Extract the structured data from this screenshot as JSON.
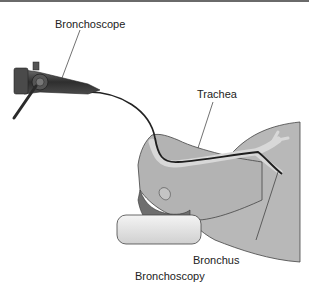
{
  "figure": {
    "caption": "Bronchoscopy",
    "labels": {
      "bronchoscope": "Bronchoscope",
      "trachea": "Trachea",
      "bronchus": "Bronchus"
    }
  },
  "colors": {
    "skin": "#b3b3b3",
    "hair": "#6e6e6e",
    "pillow": "#e6e6e6",
    "airway": "#d5d5d5",
    "scope": "#3a3a3a",
    "line": "#222222"
  }
}
